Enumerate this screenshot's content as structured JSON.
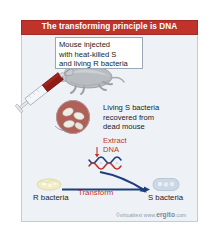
{
  "figure": {
    "title": "The transforming principle is DNA",
    "colors": {
      "title_bar": "#c0332b",
      "panel_bg": "#eef2f7",
      "panel_border": "#c3ccd6",
      "accent_red": "#c0332b",
      "arrow_blue": "#1f3f7a",
      "mouse_gray": "#b9bcc0",
      "syringe_red": "#8f1b17",
      "r_bacteria": "#f0ecc4",
      "s_bacteria": "#ccd8e6"
    }
  },
  "caption_top": {
    "lines": [
      "Mouse injected",
      "with heat-killed S",
      "and living R bacteria"
    ]
  },
  "caption_right": {
    "lines": [
      "Living S bacteria",
      "recovered from",
      "dead mouse"
    ]
  },
  "extract": {
    "lines": [
      "Extract",
      "DNA"
    ]
  },
  "bottom_row": {
    "left_label": "R bacteria",
    "arrow_label": "Transform",
    "right_label": "S bacteria"
  },
  "credit": {
    "prefix": "©virtualtext  www.",
    "brand": "ergito",
    "suffix": ".com"
  },
  "icons": {
    "mouse": "dead-mouse-icon",
    "syringe": "syringe-icon",
    "magnifier": "magnified-bacteria-icon",
    "dna": "dna-helix-icon",
    "arrow": "arrow-right-icon"
  }
}
